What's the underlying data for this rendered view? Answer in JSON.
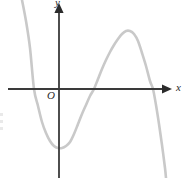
{
  "figure": {
    "width": 186,
    "height": 178,
    "background": "#ffffff"
  },
  "labels": {
    "x_axis": "x",
    "y_axis": "y",
    "origin": "O"
  },
  "colors": {
    "axis": "#3a3a3a",
    "curve": "#c9c9c9",
    "text": "#2b2b2b",
    "background": "#ffffff"
  },
  "chart_data": {
    "type": "line",
    "title": "",
    "xlabel": "x",
    "ylabel": "y",
    "grid": false,
    "legend": "none",
    "axes": {
      "origin_px": [
        59,
        89
      ],
      "x_axis_px": {
        "x1": 8,
        "y1": 89,
        "x2": 172,
        "y2": 89,
        "arrow": "right"
      },
      "y_axis_px": {
        "x1": 59,
        "y1": 178,
        "x2": 59,
        "y2": 3,
        "arrow": "up"
      },
      "xlim_px": [
        0,
        186
      ],
      "ylim_px": [
        178,
        0
      ]
    },
    "series": [
      {
        "name": "cubic curve",
        "color": "#c9c9c9",
        "width_px": 2.6,
        "description": "Cubic with negative leading coefficient: falls from upper-left, local minimum below the origin, local maximum above the axis on the right, then falls to lower-right.",
        "features": {
          "x_intercepts_px": [
            34,
            94,
            153
          ],
          "local_minimum_px": [
            60,
            148
          ],
          "local_maximum_px": [
            129,
            31
          ],
          "y_intercept_px": [
            59,
            148
          ],
          "inflection_px": [
            94,
            89
          ]
        },
        "points_px": [
          [
            22,
            0
          ],
          [
            26,
            21
          ],
          [
            30,
            48
          ],
          [
            34,
            89
          ],
          [
            38,
            106
          ],
          [
            42,
            122
          ],
          [
            46,
            133
          ],
          [
            50,
            141
          ],
          [
            54,
            146
          ],
          [
            58,
            148
          ],
          [
            62,
            148
          ],
          [
            66,
            146
          ],
          [
            70,
            142
          ],
          [
            74,
            134
          ],
          [
            78,
            124
          ],
          [
            82,
            114
          ],
          [
            86,
            105
          ],
          [
            90,
            96
          ],
          [
            94,
            89
          ],
          [
            98,
            79
          ],
          [
            102,
            69
          ],
          [
            106,
            60
          ],
          [
            110,
            52
          ],
          [
            114,
            45
          ],
          [
            118,
            39
          ],
          [
            122,
            34
          ],
          [
            126,
            31
          ],
          [
            130,
            31
          ],
          [
            134,
            34
          ],
          [
            138,
            41
          ],
          [
            142,
            53
          ],
          [
            146,
            66
          ],
          [
            150,
            81
          ],
          [
            153,
            89
          ],
          [
            156,
            105
          ],
          [
            159,
            124
          ],
          [
            162,
            145
          ],
          [
            165,
            168
          ],
          [
            166,
            178
          ]
        ]
      }
    ]
  }
}
